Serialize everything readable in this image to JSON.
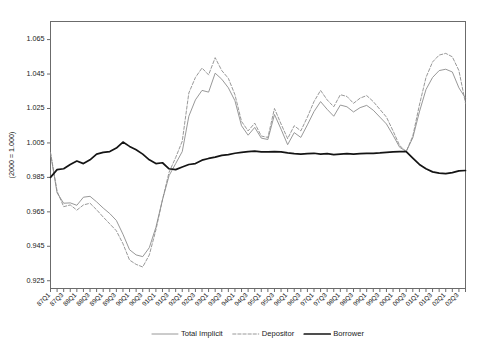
{
  "chart_data": {
    "type": "line",
    "title": "",
    "xlabel": "",
    "ylabel": "(2000 = 1.000)",
    "ylim": [
      0.9205,
      1.0755
    ],
    "yticks": [
      0.925,
      0.945,
      0.965,
      0.985,
      1.005,
      1.025,
      1.045,
      1.065
    ],
    "ytick_labels": [
      "0.925",
      "0.945",
      "0.965",
      "0.985",
      "1.005",
      "1.025",
      "1.045",
      "1.065"
    ],
    "grid": false,
    "legend_position": "bottom",
    "xtick_label_rotation": 45,
    "x": [
      "87Q1",
      "87Q2",
      "87Q3",
      "87Q4",
      "88Q1",
      "88Q2",
      "88Q3",
      "88Q4",
      "89Q1",
      "89Q2",
      "89Q3",
      "89Q4",
      "90Q1",
      "90Q2",
      "90Q3",
      "90Q4",
      "91Q1",
      "91Q2",
      "91Q3",
      "91Q4",
      "92Q1",
      "92Q2",
      "92Q3",
      "92Q4",
      "93Q1",
      "93Q2",
      "93Q3",
      "93Q4",
      "94Q1",
      "94Q2",
      "94Q3",
      "94Q4",
      "95Q1",
      "95Q2",
      "95Q3",
      "95Q4",
      "96Q1",
      "96Q2",
      "96Q3",
      "96Q4",
      "97Q1",
      "97Q2",
      "97Q3",
      "97Q4",
      "98Q1",
      "98Q2",
      "98Q3",
      "98Q4",
      "99Q1",
      "99Q2",
      "99Q3",
      "99Q4",
      "00Q1",
      "00Q2",
      "00Q3",
      "00Q4",
      "01Q1",
      "01Q2",
      "01Q3",
      "01Q4",
      "02Q1",
      "02Q2",
      "02Q3",
      "02Q4"
    ],
    "xtick_labels": [
      "87Q1",
      "87Q3",
      "88Q1",
      "88Q3",
      "89Q1",
      "89Q3",
      "90Q1",
      "90Q3",
      "91Q1",
      "91Q3",
      "92Q1",
      "92Q3",
      "93Q1",
      "93Q3",
      "94Q1",
      "94Q3",
      "95Q1",
      "95Q3",
      "96Q1",
      "96Q3",
      "97Q1",
      "97Q3",
      "98Q1",
      "98Q3",
      "99Q1",
      "99Q3",
      "00Q1",
      "00Q3",
      "01Q1",
      "01Q3",
      "02Q1",
      "02Q3"
    ],
    "series": [
      {
        "name": "Total Implicit",
        "style": "solid-thin",
        "color": "#8c8c8c",
        "values": [
          0.999,
          0.976,
          0.97,
          0.9702,
          0.9688,
          0.9735,
          0.974,
          0.9708,
          0.9672,
          0.964,
          0.96,
          0.952,
          0.943,
          0.94,
          0.939,
          0.9442,
          0.956,
          0.972,
          0.986,
          0.993,
          1.0,
          1.0205,
          1.03,
          1.0355,
          1.0345,
          1.0455,
          1.042,
          1.037,
          1.0295,
          1.015,
          1.0095,
          1.014,
          1.0078,
          1.007,
          1.0215,
          1.013,
          1.004,
          1.011,
          1.0082,
          1.0155,
          1.0232,
          1.029,
          1.0245,
          1.0205,
          1.027,
          1.026,
          1.023,
          1.0255,
          1.0268,
          1.024,
          1.02,
          1.016,
          1.0095,
          1.0025,
          1.0,
          1.008,
          1.023,
          1.036,
          1.043,
          1.047,
          1.0478,
          1.0462,
          1.037,
          1.031
        ]
      },
      {
        "name": "Depositor",
        "style": "dashed",
        "color": "#8c8c8c",
        "values": [
          0.9995,
          0.977,
          0.968,
          0.969,
          0.966,
          0.969,
          0.97,
          0.9662,
          0.962,
          0.958,
          0.954,
          0.9465,
          0.937,
          0.9345,
          0.933,
          0.94,
          0.9545,
          0.972,
          0.988,
          0.9965,
          1.006,
          1.034,
          1.043,
          1.0485,
          1.0445,
          1.0545,
          1.047,
          1.0425,
          1.033,
          1.0175,
          1.012,
          1.0165,
          1.009,
          1.0082,
          1.025,
          1.016,
          1.0075,
          1.015,
          1.012,
          1.02,
          1.029,
          1.0355,
          1.03,
          1.026,
          1.033,
          1.032,
          1.028,
          1.031,
          1.0325,
          1.029,
          1.0245,
          1.02,
          1.012,
          1.0035,
          1.0,
          1.009,
          1.027,
          1.043,
          1.052,
          1.056,
          1.057,
          1.055,
          1.047,
          1.028
        ]
      },
      {
        "name": "Borrower",
        "style": "solid-thick",
        "color": "#141414",
        "values": [
          0.985,
          0.9895,
          0.99,
          0.9925,
          0.9945,
          0.993,
          0.9952,
          0.9985,
          0.9995,
          1.0,
          1.002,
          1.0055,
          1.003,
          1.001,
          0.9985,
          0.9952,
          0.993,
          0.9935,
          0.99,
          0.9895,
          0.991,
          0.9925,
          0.993,
          0.995,
          0.996,
          0.9968,
          0.9978,
          0.9982,
          0.999,
          0.9995,
          1.0,
          1.0002,
          0.9998,
          0.9998,
          1.0,
          0.9998,
          0.9992,
          0.9988,
          0.9985,
          0.9988,
          0.999,
          0.9985,
          0.9988,
          0.9982,
          0.9985,
          0.9988,
          0.9985,
          0.9988,
          0.999,
          0.999,
          0.9992,
          0.9995,
          0.9998,
          1.0,
          1.0,
          0.9962,
          0.9925,
          0.99,
          0.9882,
          0.9875,
          0.9872,
          0.9878,
          0.9888,
          0.989
        ]
      }
    ],
    "legend": [
      {
        "label": "Total Implicit",
        "style": "solid-thin",
        "color": "#8c8c8c"
      },
      {
        "label": "Depositor",
        "style": "dashed",
        "color": "#8c8c8c"
      },
      {
        "label": "Borrower",
        "style": "solid-thick",
        "color": "#141414"
      }
    ]
  }
}
